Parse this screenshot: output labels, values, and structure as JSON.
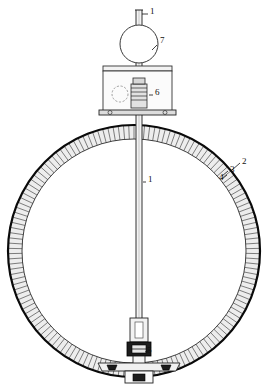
{
  "figure": {
    "background_color": "#ffffff",
    "line_color": "#111111",
    "hatch_color": "#555555",
    "fill_color": "#e8e8e8",
    "width": 268,
    "height": 387
  },
  "callouts": [
    {
      "id": "callout-1-top",
      "label": "1",
      "x": 150,
      "y": 14,
      "refers_to": "central-shaft-upper"
    },
    {
      "id": "callout-7",
      "label": "7",
      "x": 160,
      "y": 43,
      "refers_to": "spherical-weight"
    },
    {
      "id": "callout-6",
      "label": "6",
      "x": 155,
      "y": 95,
      "refers_to": "housing-enclosure"
    },
    {
      "id": "callout-2",
      "label": "2",
      "x": 242,
      "y": 164,
      "refers_to": "outer-ring-rim"
    },
    {
      "id": "callout-3",
      "label": "3",
      "x": 230,
      "y": 172,
      "refers_to": "ring-hatched-body"
    },
    {
      "id": "callout-4",
      "label": "4",
      "x": 219,
      "y": 180,
      "refers_to": "inner-ring-edge"
    },
    {
      "id": "callout-1-center",
      "label": "1",
      "x": 148,
      "y": 182,
      "refers_to": "central-shaft-lower"
    },
    {
      "id": "callout-5",
      "label": "5",
      "x": 147,
      "y": 353,
      "refers_to": "base-coupling-block"
    }
  ],
  "geometry": {
    "ring": {
      "name": "annular-ring",
      "center_x": 134,
      "center_y": 251,
      "outer_radius": 126,
      "inner_radius": 112,
      "hatch_tick_count": 150
    },
    "shaft": {
      "name": "central-vertical-shaft",
      "x": 139,
      "top_y": 10,
      "bottom_y": 344,
      "width": 6
    },
    "sphere": {
      "name": "spherical-weight",
      "center_x": 139,
      "center_y": 44,
      "radius": 19
    },
    "housing": {
      "name": "housing-enclosure",
      "left": 103,
      "top": 66,
      "right": 172,
      "bottom": 112,
      "port_circle_x": 120,
      "port_circle_y": 94,
      "port_circle_r": 8
    },
    "base": {
      "name": "base-coupling-block",
      "center_x": 139,
      "top_y": 318,
      "bottom_y": 383
    }
  }
}
